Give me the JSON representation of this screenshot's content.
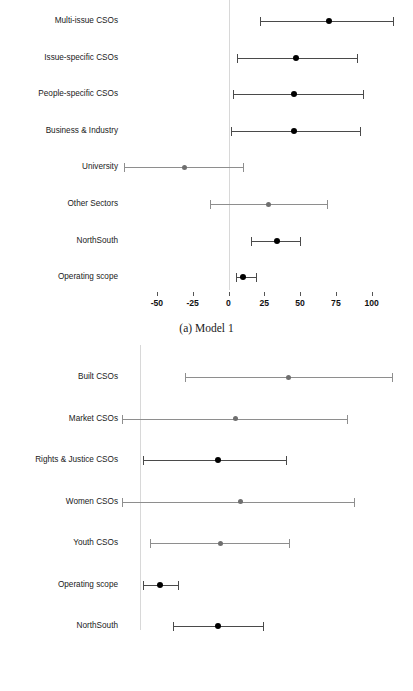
{
  "figure": {
    "panels": [
      {
        "id": "a",
        "caption": "(a) Model 1",
        "axis": {
          "ticks": [
            -50,
            -25,
            0,
            25,
            50,
            75,
            100
          ],
          "tick_labels": [
            "-50",
            "-25",
            "0",
            "25",
            "50",
            "75",
            "100"
          ],
          "xlim": [
            -80,
            125
          ],
          "zero_px": 228.5,
          "px_per_unit": 1.432
        },
        "rows": [
          {
            "label": "Multi-issue CSOs",
            "estimate": 70,
            "lower": 22,
            "upper": 115,
            "shade": "dark"
          },
          {
            "label": "Issue-specific CSOs",
            "estimate": 47,
            "lower": 6,
            "upper": 90,
            "shade": "dark"
          },
          {
            "label": "People-specific CSOs",
            "estimate": 46,
            "lower": 3,
            "upper": 94,
            "shade": "dark"
          },
          {
            "label": "Business & Industry",
            "estimate": 46,
            "lower": 2,
            "upper": 92,
            "shade": "dark"
          },
          {
            "label": "University",
            "estimate": -31,
            "lower": -73,
            "upper": 10,
            "shade": "light"
          },
          {
            "label": "Other Sectors",
            "estimate": 28,
            "lower": -13,
            "upper": 69,
            "shade": "light"
          },
          {
            "label": "NorthSouth",
            "estimate": 34,
            "lower": 16,
            "upper": 50,
            "shade": "dark"
          },
          {
            "label": "Operating scope",
            "estimate": 10,
            "lower": 5,
            "upper": 19,
            "shade": "dark"
          }
        ]
      },
      {
        "id": "b",
        "caption": "(b) Model 2",
        "axis": {
          "ticks": [
            0,
            25,
            50,
            75,
            100
          ],
          "tick_labels": [
            "0",
            "25",
            "50",
            "75",
            "100"
          ],
          "xlim": [
            -12,
            108
          ],
          "zero_px": 140.0,
          "px_per_unit": 2.52
        },
        "rows": [
          {
            "label": "Built CSOs",
            "estimate": 59,
            "lower": 18,
            "upper": 100,
            "shade": "light"
          },
          {
            "label": "Market CSOs",
            "estimate": 38,
            "lower": -7,
            "upper": 82,
            "shade": "light"
          },
          {
            "label": "Rights & Justice CSOs",
            "estimate": 31,
            "lower": 1,
            "upper": 58,
            "shade": "dark"
          },
          {
            "label": "Women CSOs",
            "estimate": 40,
            "lower": -7,
            "upper": 85,
            "shade": "light"
          },
          {
            "label": "Youth CSOs",
            "estimate": 32,
            "lower": 4,
            "upper": 59,
            "shade": "light"
          },
          {
            "label": "Operating scope",
            "estimate": 8,
            "lower": 1,
            "upper": 15,
            "shade": "dark"
          },
          {
            "label": "NorthSouth",
            "estimate": 31,
            "lower": 13,
            "upper": 49,
            "shade": "dark"
          }
        ]
      }
    ]
  },
  "chart_data": {
    "type": "scatter",
    "subtype": "forest-plot",
    "title": "",
    "xlabel": "",
    "ylabel": "",
    "grid": false,
    "legend": "none",
    "panels": [
      {
        "name": "(a) Model 1",
        "xlim": [
          -80,
          125
        ],
        "xticks": [
          -50,
          -25,
          0,
          25,
          50,
          75,
          100
        ],
        "reference_line": 0,
        "categories": [
          "Multi-issue CSOs",
          "Issue-specific CSOs",
          "People-specific CSOs",
          "Business & Industry",
          "University",
          "Other Sectors",
          "NorthSouth",
          "Operating scope"
        ],
        "estimates": [
          70,
          47,
          46,
          46,
          -31,
          28,
          34,
          10
        ],
        "ci_lower": [
          22,
          6,
          3,
          2,
          -73,
          -13,
          16,
          5
        ],
        "ci_upper": [
          115,
          90,
          94,
          92,
          10,
          69,
          50,
          19
        ]
      },
      {
        "name": "(b) Model 2",
        "xlim": [
          -12,
          108
        ],
        "xticks": [
          0,
          25,
          50,
          75,
          100
        ],
        "reference_line": 0,
        "categories": [
          "Built CSOs",
          "Market CSOs",
          "Rights & Justice CSOs",
          "Women CSOs",
          "Youth CSOs",
          "Operating scope",
          "NorthSouth"
        ],
        "estimates": [
          59,
          38,
          31,
          40,
          32,
          8,
          31
        ],
        "ci_lower": [
          18,
          -7,
          1,
          -7,
          4,
          1,
          13
        ],
        "ci_upper": [
          100,
          82,
          58,
          85,
          59,
          15,
          49
        ]
      }
    ]
  },
  "colors": {
    "point_dark": "#000000",
    "point_light": "#6f6f6f",
    "line_dark": "#4a4a4a",
    "line_light": "#8e8e8e",
    "zero_line": "#d8d8d8",
    "background": "#ffffff"
  }
}
